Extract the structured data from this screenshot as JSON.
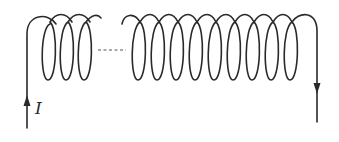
{
  "diagram": {
    "current_label": "I",
    "left_group_turns": 3,
    "right_group_turns": 9,
    "gap_style": "dashed",
    "current_direction": "enters at left wire (upward), exits at right wire (downward)",
    "colors": {
      "stroke": "#2a2a2a",
      "background": "#ffffff"
    }
  }
}
